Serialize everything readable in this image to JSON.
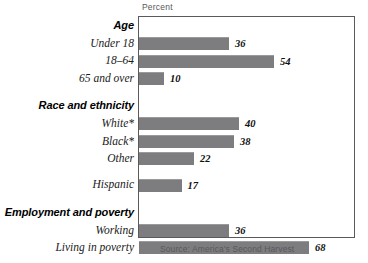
{
  "chart_data": {
    "type": "bar",
    "orientation": "horizontal",
    "title": "",
    "xlabel": "Percent",
    "ylabel": "",
    "xlim": [
      0,
      86
    ],
    "grid": false,
    "legend": null,
    "source": "Source: America's Second Harvest",
    "groups": [
      {
        "name": "Age",
        "categories": [
          "Under 18",
          "18–64",
          "65 and over"
        ],
        "values": [
          36,
          54,
          10
        ]
      },
      {
        "name": "Race and ethnicity",
        "categories": [
          "White*",
          "Black*",
          "Other",
          "Hispanic"
        ],
        "values": [
          40,
          38,
          22,
          17
        ]
      },
      {
        "name": "Employment and poverty",
        "categories": [
          "Working",
          "Living in poverty"
        ],
        "values": [
          36,
          68
        ]
      }
    ],
    "categories": [
      "Under 18",
      "18–64",
      "65 and over",
      "White*",
      "Black*",
      "Other",
      "Hispanic",
      "Working",
      "Living in poverty"
    ],
    "values": [
      36,
      54,
      10,
      40,
      38,
      22,
      17,
      36,
      68
    ],
    "bar_color": "#7d7d7f"
  },
  "rows": [
    {
      "kind": "group",
      "label": "Age"
    },
    {
      "kind": "bar",
      "label": "Under 18",
      "value": 36,
      "gap": false
    },
    {
      "kind": "bar",
      "label": "18–64",
      "value": 54,
      "gap": false
    },
    {
      "kind": "bar",
      "label": "65 and over",
      "value": 10,
      "gap": false
    },
    {
      "kind": "group",
      "label": "Race and ethnicity",
      "gap": true
    },
    {
      "kind": "bar",
      "label": "White*",
      "value": 40,
      "gap": false
    },
    {
      "kind": "bar",
      "label": "Black*",
      "value": 38,
      "gap": false
    },
    {
      "kind": "bar",
      "label": "Other",
      "value": 22,
      "gap": false
    },
    {
      "kind": "bar",
      "label": "Hispanic",
      "value": 17,
      "gap": true
    },
    {
      "kind": "group",
      "label": "Employment and poverty",
      "gap": true
    },
    {
      "kind": "bar",
      "label": "Working",
      "value": 36,
      "gap": false
    },
    {
      "kind": "bar",
      "label": "Living in poverty",
      "value": 68,
      "gap": false
    }
  ],
  "axis": {
    "caption": "Percent"
  },
  "footer": {
    "source": "Source: America's Second Harvest"
  }
}
